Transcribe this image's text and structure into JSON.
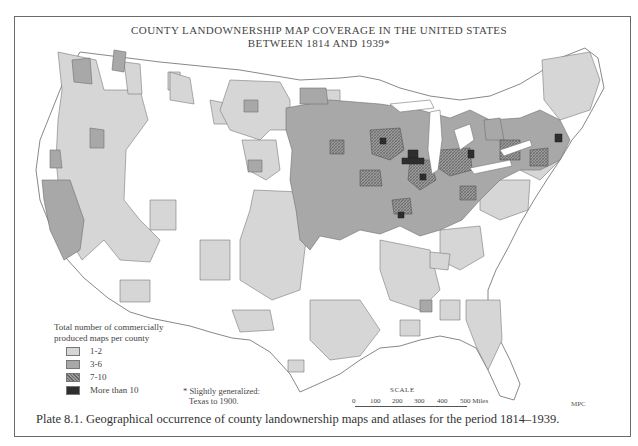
{
  "title": {
    "line1": "COUNTY LANDOWNERSHIP MAP COVERAGE IN THE UNITED STATES",
    "line2": "BETWEEN 1814 AND 1939*"
  },
  "legend": {
    "header": "Total number of commercially produced maps per county",
    "items": [
      {
        "label": "1-2",
        "color": "#d6d6d6",
        "pattern": "light"
      },
      {
        "label": "3-6",
        "color": "#a8a8a8",
        "pattern": "medium"
      },
      {
        "label": "7-10",
        "color": "#8f8f8f",
        "pattern": "crosshatch"
      },
      {
        "label": "More than 10",
        "color": "#2e2e2e",
        "pattern": "dark"
      }
    ]
  },
  "footnote": {
    "line1": "* Slightly generalized:",
    "line2": "Texas to 1900."
  },
  "scale": {
    "label": "SCALE",
    "ticks": [
      "0",
      "100",
      "200",
      "300",
      "400",
      "500 Miles"
    ]
  },
  "credit": "MPC",
  "caption": "Plate 8.1. Geographical occurrence of county landownership maps and atlases for the period 1814–1939.",
  "colors": {
    "class_1_2": "#d6d6d6",
    "class_3_6": "#a8a8a8",
    "class_7_10": "#8f8f8f",
    "class_over_10": "#2e2e2e",
    "outline": "#6e6e6e"
  }
}
